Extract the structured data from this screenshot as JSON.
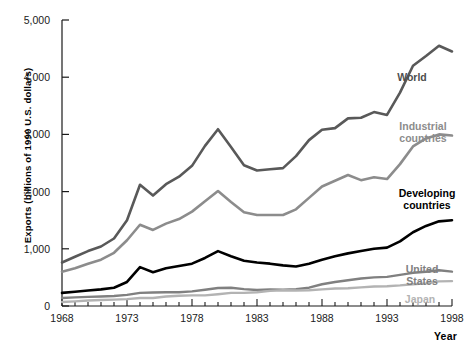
{
  "chart_data": {
    "type": "line",
    "title": "",
    "xlabel": "Year",
    "ylabel": "Exports (billions of 1990 U.S. dollars)",
    "xlim": [
      1968,
      1998
    ],
    "ylim": [
      0,
      5000
    ],
    "grid": false,
    "legend_position": "inline-right",
    "y_ticks": [
      0,
      1000,
      2000,
      3000,
      4000,
      5000
    ],
    "y_tick_labels": [
      "0",
      "1,000",
      "2,000",
      "3,000",
      "4,000",
      "5,000"
    ],
    "x_ticks": [
      1968,
      1973,
      1978,
      1983,
      1988,
      1993,
      1998
    ],
    "x_tick_labels": [
      "1968",
      "1973",
      "1978",
      "1983",
      "1988",
      "1993",
      "1998"
    ],
    "x_minor_tick_interval": 1,
    "x": [
      1968,
      1969,
      1970,
      1971,
      1972,
      1973,
      1974,
      1975,
      1976,
      1977,
      1978,
      1979,
      1980,
      1981,
      1982,
      1983,
      1984,
      1985,
      1986,
      1987,
      1988,
      1989,
      1990,
      1991,
      1992,
      1993,
      1994,
      1995,
      1996,
      1997,
      1998
    ],
    "series": [
      {
        "name": "World",
        "color": "#595959",
        "width": 2.6,
        "label": "World",
        "label_color": "#4d4d4d",
        "values": [
          760,
          860,
          960,
          1040,
          1180,
          1500,
          2120,
          1930,
          2130,
          2260,
          2450,
          2800,
          3090,
          2780,
          2460,
          2370,
          2390,
          2410,
          2620,
          2900,
          3080,
          3110,
          3280,
          3290,
          3390,
          3340,
          3730,
          4200,
          4370,
          4550,
          4450
        ]
      },
      {
        "name": "Industrial countries",
        "color": "#8c8c8c",
        "width": 2.6,
        "label": "Industrial\ncountries",
        "label_color": "#8c8c8c",
        "values": [
          600,
          660,
          740,
          810,
          930,
          1150,
          1420,
          1330,
          1440,
          1520,
          1650,
          1830,
          2010,
          1820,
          1640,
          1590,
          1590,
          1590,
          1690,
          1890,
          2090,
          2190,
          2290,
          2200,
          2250,
          2220,
          2480,
          2790,
          2930,
          3000,
          2980
        ]
      },
      {
        "name": "Developing countries",
        "color": "#000000",
        "width": 2.6,
        "label": "Developing\ncountries",
        "label_color": "#000000",
        "values": [
          230,
          250,
          270,
          290,
          320,
          420,
          680,
          590,
          660,
          700,
          740,
          840,
          960,
          870,
          790,
          760,
          740,
          710,
          690,
          740,
          810,
          870,
          920,
          960,
          1000,
          1020,
          1130,
          1290,
          1400,
          1480,
          1500
        ]
      },
      {
        "name": "United States",
        "color": "#808080",
        "width": 2.4,
        "label": "United States",
        "label_color": "#808080",
        "values": [
          140,
          150,
          160,
          165,
          175,
          195,
          230,
          235,
          240,
          240,
          255,
          285,
          315,
          320,
          295,
          280,
          290,
          285,
          295,
          320,
          380,
          420,
          450,
          480,
          500,
          510,
          545,
          580,
          600,
          625,
          600
        ]
      },
      {
        "name": "Japan",
        "color": "#b3b3b3",
        "width": 2.4,
        "label": "Japan",
        "label_color": "#b3b3b3",
        "values": [
          70,
          80,
          95,
          105,
          112,
          120,
          140,
          140,
          165,
          180,
          185,
          185,
          205,
          230,
          230,
          240,
          265,
          275,
          270,
          275,
          290,
          305,
          310,
          325,
          340,
          345,
          360,
          380,
          395,
          430,
          435
        ]
      }
    ],
    "annotations": [
      {
        "name": "world-label",
        "text": "World",
        "x_px": 412,
        "y_px": 72
      },
      {
        "name": "industrial-countries-label",
        "text": "Industrial\ncountries",
        "x_px": 423,
        "y_px": 121
      },
      {
        "name": "developing-countries-label",
        "text": "Developing\ncountries",
        "x_px": 427,
        "y_px": 188
      },
      {
        "name": "united-states-label",
        "text": "United States",
        "x_px": 422,
        "y_px": 264
      },
      {
        "name": "japan-label",
        "text": "Japan",
        "x_px": 420,
        "y_px": 294
      }
    ]
  }
}
